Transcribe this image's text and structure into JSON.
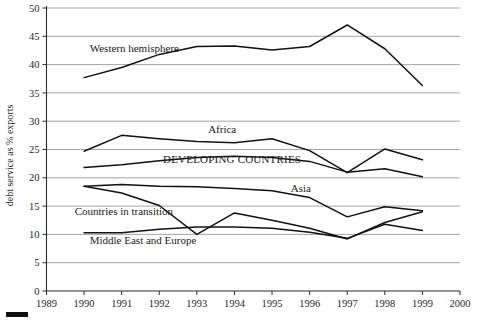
{
  "chart_data": {
    "type": "line",
    "title": "",
    "xlabel": "",
    "ylabel": "debt service as % exports",
    "xlim": [
      1989,
      2000
    ],
    "ylim": [
      0,
      50
    ],
    "grid": true,
    "legend_position": "inline-annotations",
    "x": [
      1990,
      1991,
      1992,
      1993,
      1994,
      1995,
      1996,
      1997,
      1998,
      1999
    ],
    "xticks": [
      "1989",
      "1990",
      "1991",
      "1992",
      "1993",
      "1994",
      "1995",
      "1996",
      "1997",
      "1998",
      "1999",
      "2000"
    ],
    "yticks": [
      "0",
      "5",
      "10",
      "15",
      "20",
      "25",
      "30",
      "35",
      "40",
      "45",
      "50"
    ],
    "series": [
      {
        "name": "Western hemisphere",
        "label": "Western hemisphere",
        "label_x": 1990.15,
        "label_y": 42.3,
        "values": [
          37.7,
          39.5,
          41.8,
          43.2,
          43.3,
          42.6,
          43.2,
          47.0,
          42.8,
          36.3
        ]
      },
      {
        "name": "Africa",
        "label": "Africa",
        "label_x": 1993.3,
        "label_y": 27.9,
        "values": [
          24.7,
          27.5,
          26.9,
          26.4,
          26.2,
          26.9,
          24.8,
          20.9,
          25.1,
          23.2
        ]
      },
      {
        "name": "DEVELOPING COUNTRIES",
        "label": "DEVELOPING COUNTRIES",
        "label_x": 1992.1,
        "label_y": 22.6,
        "values": [
          21.8,
          22.3,
          23.0,
          23.6,
          23.8,
          23.6,
          22.9,
          21.0,
          21.6,
          20.2
        ]
      },
      {
        "name": "Asia",
        "label": "Asia",
        "label_x": 1995.5,
        "label_y": 17.5,
        "values": [
          18.5,
          18.8,
          18.5,
          18.4,
          18.1,
          17.7,
          16.5,
          13.1,
          14.9,
          14.2
        ]
      },
      {
        "name": "Countries in transition",
        "label": "Countries in transition",
        "label_x": 1989.75,
        "label_y": 13.4,
        "values": [
          18.5,
          17.3,
          15.1,
          10.0,
          13.8,
          12.5,
          11.1,
          9.2,
          12.1,
          14.0
        ]
      },
      {
        "name": "Middle East and Europe",
        "label": "Middle East and Europe",
        "label_x": 1990.15,
        "label_y": 8.3,
        "values": [
          10.3,
          10.3,
          10.9,
          11.3,
          11.3,
          11.1,
          10.4,
          9.3,
          11.8,
          10.7
        ]
      }
    ],
    "colors": {
      "line": "#111111",
      "grid": "#8e8e8e",
      "axis": "#2b2b2b",
      "text": "#262626",
      "background": "#ffffff"
    }
  },
  "legend_stub": {
    "name": "legend-bar"
  }
}
